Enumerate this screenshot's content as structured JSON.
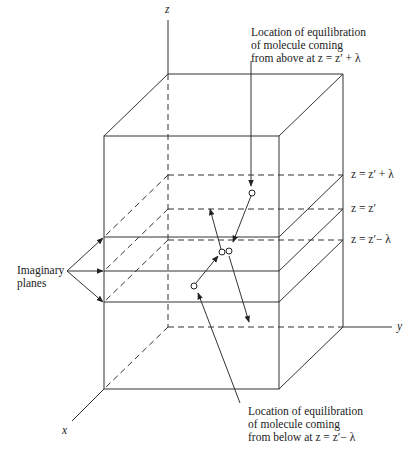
{
  "diagram": {
    "axes": {
      "z_label": "z",
      "y_label": "y",
      "x_label": "x"
    },
    "plane_labels": [
      "z = z′ + λ",
      "z = z′",
      "z = z′− λ"
    ],
    "left_annotation": {
      "line1": "Imaginary",
      "line2": "planes"
    },
    "top_annotation": {
      "line1": "Location of equilibration",
      "line2": "of molecule coming",
      "line3": "from above at z = z′ + λ"
    },
    "bottom_annotation": {
      "line1": "Location of equilibration",
      "line2": "of molecule coming",
      "line3": "from below at z = z′− λ"
    },
    "colors": {
      "line": "#333333",
      "background": "#ffffff"
    }
  }
}
